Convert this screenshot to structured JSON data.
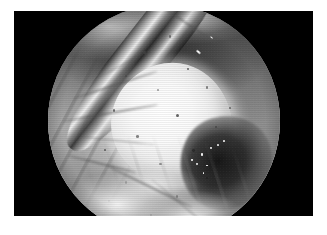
{
  "page": {
    "background_color": "#ffffff",
    "width": 327,
    "height": 235
  },
  "figure": {
    "type": "photograph",
    "modality": "endoscopic-video-still",
    "color_mode": "grayscale",
    "caption": "",
    "frame": {
      "background_color": "#000000",
      "left": 14,
      "top": 11,
      "width": 299,
      "height": 205
    },
    "field_of_view": {
      "shape": "circle",
      "label": "endoscope-circular-field-of-view",
      "diameter": 232,
      "center_x": 150,
      "center_y": 110
    }
  },
  "scene": {
    "description": "Grayscale endoscopic view of a bright rounded mass surrounded by soft tissue folds with a metallic instrument entering from the upper right.",
    "regions": [
      {
        "id": "upper-fold",
        "label": "Upper tissue fold",
        "tone": "dark",
        "tone_hex": "#3f3f3f"
      },
      {
        "id": "left-flank",
        "label": "Left tissue flank with vascular striations",
        "tone": "mid",
        "tone_hex": "#9a9a9a"
      },
      {
        "id": "mass",
        "label": "Bright ovoid mass",
        "tone": "bright",
        "tone_hex": "#f8f8f8"
      },
      {
        "id": "dark-recess",
        "label": "Shadowed recess",
        "tone": "dark",
        "tone_hex": "#141414"
      },
      {
        "id": "lower-folds",
        "label": "Lower tissue folds",
        "tone": "bright",
        "tone_hex": "#ededed"
      },
      {
        "id": "instrument",
        "label": "Metallic instrument shaft",
        "tone": "specular",
        "tone_hex": "#e8e8e8"
      }
    ],
    "speckles": [
      {
        "x": 41,
        "y": 20,
        "d": 3.0
      },
      {
        "x": 52,
        "y": 13,
        "d": 2.4
      },
      {
        "x": 33,
        "y": 30,
        "d": 2.6
      },
      {
        "x": 60,
        "y": 27,
        "d": 2.2
      },
      {
        "x": 47,
        "y": 36,
        "d": 2.0
      },
      {
        "x": 68,
        "y": 35,
        "d": 2.6
      },
      {
        "x": 28,
        "y": 45,
        "d": 2.2
      },
      {
        "x": 55,
        "y": 47,
        "d": 3.0
      },
      {
        "x": 72,
        "y": 52,
        "d": 2.4
      },
      {
        "x": 38,
        "y": 56,
        "d": 2.6
      },
      {
        "x": 62,
        "y": 62,
        "d": 2.8
      },
      {
        "x": 24,
        "y": 62,
        "d": 2.0
      },
      {
        "x": 48,
        "y": 68,
        "d": 2.4
      },
      {
        "x": 33,
        "y": 76,
        "d": 2.6
      },
      {
        "x": 68,
        "y": 74,
        "d": 2.0
      },
      {
        "x": 55,
        "y": 82,
        "d": 2.4
      },
      {
        "x": 18,
        "y": 50,
        "d": 2.2
      },
      {
        "x": 44,
        "y": 90,
        "d": 2.0
      },
      {
        "x": 78,
        "y": 44,
        "d": 2.0
      },
      {
        "x": 26,
        "y": 84,
        "d": 1.8
      }
    ],
    "instrument_glints": [
      {
        "x": 64,
        "y": 20,
        "w": 5.0,
        "h": 1.8,
        "r": 40
      },
      {
        "x": 58,
        "y": 27,
        "w": 4.0,
        "h": 1.6,
        "r": 40
      },
      {
        "x": 52,
        "y": 33,
        "w": 3.2,
        "h": 1.5,
        "r": 40
      },
      {
        "x": 70,
        "y": 14,
        "w": 3.0,
        "h": 1.4,
        "r": 40
      }
    ],
    "wet_highlights": [
      {
        "x": 22,
        "y": 40,
        "d": 2.8
      },
      {
        "x": 32,
        "y": 33,
        "d": 2.2
      },
      {
        "x": 17,
        "y": 50,
        "d": 2.4
      },
      {
        "x": 28,
        "y": 52,
        "d": 1.8
      },
      {
        "x": 40,
        "y": 30,
        "d": 2.0
      },
      {
        "x": 12,
        "y": 46,
        "d": 1.6
      },
      {
        "x": 46,
        "y": 26,
        "d": 1.8
      },
      {
        "x": 24,
        "y": 60,
        "d": 1.6
      }
    ],
    "creases": [
      {
        "x": 10,
        "y": 34,
        "w": 38,
        "h": 1.6,
        "r": -18
      },
      {
        "x": 6,
        "y": 46,
        "w": 42,
        "h": 1.8,
        "r": -10
      },
      {
        "x": 12,
        "y": 58,
        "w": 34,
        "h": 1.4,
        "r": 6
      },
      {
        "x": 8,
        "y": 68,
        "w": 30,
        "h": 1.6,
        "r": 14
      },
      {
        "x": 24,
        "y": 78,
        "w": 40,
        "h": 1.5,
        "r": 26
      },
      {
        "x": 40,
        "y": 86,
        "w": 36,
        "h": 1.4,
        "r": 40
      },
      {
        "x": 20,
        "y": 24,
        "w": 30,
        "h": 1.4,
        "r": -28
      },
      {
        "x": 48,
        "y": 8,
        "w": 26,
        "h": 1.6,
        "r": 34
      }
    ]
  }
}
